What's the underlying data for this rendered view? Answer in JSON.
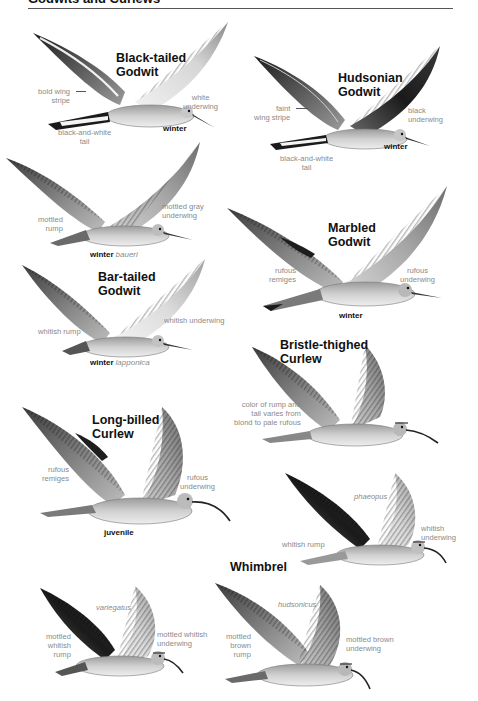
{
  "page": {
    "header": "Godwits and Curlews",
    "colors": {
      "label_gray": "#8a8a8a",
      "title": "#111111",
      "rule": "#555555"
    }
  },
  "species": [
    {
      "id": "black-tailed-godwit",
      "name_line1": "Black-tailed",
      "name_line2": "Godwit",
      "plumage": "winter",
      "subspecies": "",
      "labels": {
        "wing": "bold wing stripe",
        "wing_l1": "bold wing",
        "wing_l2": "stripe",
        "underwing_l1": "white",
        "underwing_l2": "underwing",
        "tail_l1": "black-and-white",
        "tail_l2": "tail"
      }
    },
    {
      "id": "hudsonian-godwit",
      "name_line1": "Hudsonian",
      "name_line2": "Godwit",
      "plumage": "winter",
      "subspecies": "",
      "labels": {
        "wing_l1": "faint",
        "wing_l2": "wing stripe",
        "underwing_l1": "black",
        "underwing_l2": "underwing",
        "tail_l1": "black-and-white",
        "tail_l2": "tail"
      }
    },
    {
      "id": "bar-tailed-godwit-baueri",
      "name_line1": "",
      "name_line2": "",
      "plumage": "winter",
      "subspecies": "baueri",
      "labels": {
        "rump_l1": "mottled",
        "rump_l2": "rump",
        "underwing_l1": "mottled gray",
        "underwing_l2": "underwing"
      }
    },
    {
      "id": "marbled-godwit",
      "name_line1": "Marbled",
      "name_line2": "Godwit",
      "plumage": "winter",
      "subspecies": "",
      "labels": {
        "remiges_l1": "rufous",
        "remiges_l2": "remiges",
        "underwing_l1": "rufous",
        "underwing_l2": "underwing"
      }
    },
    {
      "id": "bar-tailed-godwit-lapponica",
      "name_line1": "Bar-tailed",
      "name_line2": "Godwit",
      "plumage": "winter",
      "subspecies": "lapponica",
      "labels": {
        "rump": "whitish rump",
        "underwing": "whitish underwing"
      }
    },
    {
      "id": "bristle-thighed-curlew",
      "name_line1": "Bristle-thighed",
      "name_line2": "Curlew",
      "plumage": "",
      "subspecies": "",
      "labels": {
        "rump_l1": "color of rump and",
        "rump_l2": "tail varies from",
        "rump_l3": "blond to pale rufous"
      }
    },
    {
      "id": "long-billed-curlew",
      "name_line1": "Long-billed",
      "name_line2": "Curlew",
      "plumage": "juvenile",
      "subspecies": "",
      "labels": {
        "remiges_l1": "rufous",
        "remiges_l2": "remiges",
        "underwing_l1": "rufous",
        "underwing_l2": "underwing"
      }
    },
    {
      "id": "whimbrel-phaeopus",
      "name_line1": "",
      "name_line2": "",
      "plumage": "",
      "subspecies": "phaeopus",
      "labels": {
        "rump": "whitish rump",
        "underwing_l1": "whitish",
        "underwing_l2": "underwing"
      }
    },
    {
      "id": "whimbrel-variegatus",
      "name_line1": "",
      "name_line2": "",
      "plumage": "",
      "subspecies": "variegatus",
      "labels": {
        "rump_l1": "mottled",
        "rump_l2": "whitish",
        "rump_l3": "rump",
        "underwing_l1": "mottled whitish",
        "underwing_l2": "underwing"
      }
    },
    {
      "id": "whimbrel-hudsonicus",
      "name_line1": "Whimbrel",
      "name_line2": "",
      "plumage": "",
      "subspecies": "hudsonicus",
      "labels": {
        "rump_l1": "mottled",
        "rump_l2": "brown",
        "rump_l3": "rump",
        "underwing_l1": "mottled brown",
        "underwing_l2": "underwing"
      }
    }
  ]
}
